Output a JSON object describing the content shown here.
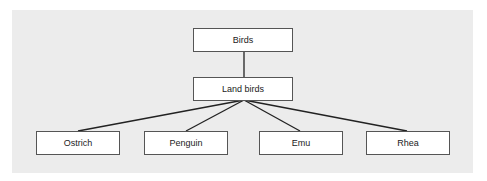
{
  "diagram": {
    "type": "tree",
    "root": {
      "label": "Birds"
    },
    "level1": {
      "label": "Land birds"
    },
    "leaves": [
      {
        "label": "Ostrich"
      },
      {
        "label": "Penguin"
      },
      {
        "label": "Emu"
      },
      {
        "label": "Rhea"
      }
    ],
    "colors": {
      "background": "#ececec",
      "box": "#ffffff",
      "line": "#222222"
    }
  }
}
